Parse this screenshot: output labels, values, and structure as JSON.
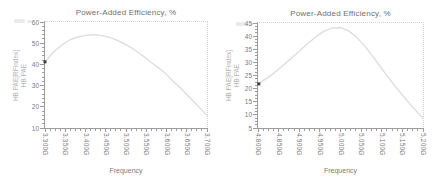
{
  "chart_data": [
    {
      "type": "line",
      "title": "Power-Added Efficiency, %",
      "xlabel": "Frequency",
      "ylabel": [
        "HB PAE[RFindex]",
        "HB PAE"
      ],
      "xlim": [
        3.3,
        3.7
      ],
      "ylim": [
        10,
        60
      ],
      "x_tick_values": [
        3.3,
        3.35,
        3.4,
        3.45,
        3.5,
        3.55,
        3.6,
        3.65,
        3.7
      ],
      "x_tick_labels": [
        "3.300G",
        "3.350G",
        "3.400G",
        "3.450G",
        "3.500G",
        "3.550G",
        "3.600G",
        "3.650G",
        "3.700G"
      ],
      "y_tick_values": [
        10,
        20,
        30,
        40,
        50,
        60
      ],
      "y_tick_labels": [
        "10",
        "20",
        "30",
        "40",
        "50",
        "60"
      ],
      "x_minor_divisions": 4,
      "y_minor_divisions": 5,
      "grid": false,
      "legend": "none",
      "series": [
        {
          "name": "HB PAE",
          "color": "#dcdcdc",
          "x": [
            3.3,
            3.32,
            3.34,
            3.36,
            3.38,
            3.4,
            3.42,
            3.44,
            3.46,
            3.48,
            3.5,
            3.52,
            3.54,
            3.56,
            3.58,
            3.6,
            3.615,
            3.63,
            3.65,
            3.67,
            3.685,
            3.7
          ],
          "y": [
            41.2,
            45.6,
            48.9,
            51.4,
            52.9,
            53.7,
            54.0,
            53.6,
            52.7,
            51.2,
            49.3,
            47.0,
            44.3,
            41.3,
            38.4,
            35.3,
            32.3,
            29.7,
            25.8,
            21.9,
            18.9,
            16.0
          ]
        }
      ],
      "marker": {
        "x": 3.3,
        "y": 41.2,
        "color": "#3d3d3d"
      }
    },
    {
      "type": "line",
      "title": "Power-Added Efficiency, %",
      "xlabel": "Frequency",
      "ylabel": [
        "HB PAE[RFindex]",
        "HB PAE"
      ],
      "xlim": [
        4.8,
        5.2
      ],
      "ylim": [
        5,
        45
      ],
      "x_tick_values": [
        4.8,
        4.85,
        4.9,
        4.95,
        5.0,
        5.05,
        5.1,
        5.15,
        5.2
      ],
      "x_tick_labels": [
        "4.800G",
        "4.850G",
        "4.900G",
        "4.950G",
        "5.000G",
        "5.050G",
        "5.100G",
        "5.150G",
        "5.200G"
      ],
      "y_tick_values": [
        5,
        10,
        15,
        20,
        25,
        30,
        35,
        40,
        45
      ],
      "y_tick_labels": [
        "5",
        "10",
        "15",
        "20",
        "25",
        "30",
        "35",
        "40",
        "45"
      ],
      "x_minor_divisions": 4,
      "y_minor_divisions": 4,
      "grid": false,
      "legend": "none",
      "series": [
        {
          "name": "HB PAE",
          "color": "#dcdcdc",
          "x": [
            4.8,
            4.82,
            4.84,
            4.86,
            4.88,
            4.9,
            4.92,
            4.94,
            4.96,
            4.98,
            5.0,
            5.02,
            5.04,
            5.06,
            5.08,
            5.1,
            5.12,
            5.14,
            5.16,
            5.18,
            5.2
          ],
          "y": [
            21.8,
            23.8,
            26.1,
            28.7,
            31.5,
            34.3,
            37.1,
            39.7,
            41.9,
            43.1,
            43.2,
            42.0,
            39.5,
            36.0,
            31.9,
            27.6,
            23.4,
            19.4,
            15.7,
            12.1,
            8.7
          ]
        }
      ],
      "marker": {
        "x": 4.802,
        "y": 21.8,
        "color": "#3d3d3d"
      }
    }
  ]
}
